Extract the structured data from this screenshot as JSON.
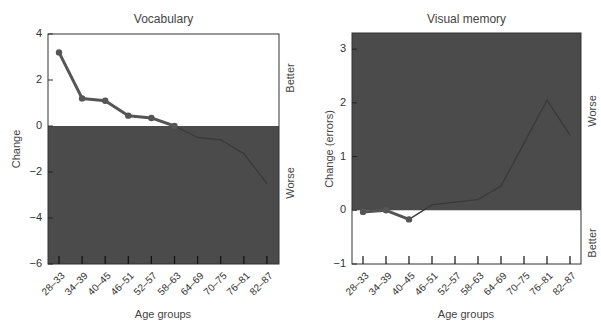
{
  "chart_data": [
    {
      "type": "line",
      "title": "Vocabulary",
      "xlabel": "Age groups",
      "ylabel": "Change",
      "categories": [
        "28–33",
        "34–39",
        "40–45",
        "46–51",
        "52–57",
        "58–63",
        "64–69",
        "70–75",
        "76–81",
        "82–87"
      ],
      "values": [
        3.2,
        1.2,
        1.1,
        0.45,
        0.35,
        0.0,
        -0.5,
        -0.6,
        -1.2,
        -2.5
      ],
      "ylim": [
        -6,
        4
      ],
      "yticks": [
        "4",
        "2",
        "0",
        "−2",
        "−4",
        "−6"
      ],
      "shaded_region": "below 0",
      "side_labels": {
        "top": "Better",
        "bottom": "Worse"
      },
      "grid": false,
      "legend": null
    },
    {
      "type": "line",
      "title": "Visual memory",
      "xlabel": "Age groups",
      "ylabel": "Change (errors)",
      "categories": [
        "28–33",
        "34–39",
        "40–45",
        "46–51",
        "52–57",
        "58–63",
        "64–69",
        "70–75",
        "76–81",
        "82–87"
      ],
      "values": [
        -0.03,
        0.0,
        -0.17,
        0.1,
        0.15,
        0.2,
        0.45,
        1.25,
        2.05,
        1.4
      ],
      "ylim": [
        -1,
        3.3
      ],
      "yticks": [
        "3",
        "2",
        "1",
        "0",
        "−1"
      ],
      "shaded_region": "above 0",
      "side_labels": {
        "top": "Worse",
        "bottom": "Better"
      },
      "grid": false,
      "legend": null
    }
  ],
  "colors": {
    "shade": "#4b4b4b",
    "line": "#555555",
    "line_dark": "#3a3a3a",
    "frame": "#333333"
  }
}
